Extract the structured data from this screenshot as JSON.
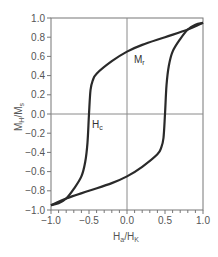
{
  "chart_data": {
    "type": "line",
    "title": "",
    "xlabel": "H_a/H_K",
    "ylabel": "M_H/M_s",
    "xlim": [
      -1.0,
      1.0
    ],
    "ylim": [
      -1.0,
      1.0
    ],
    "x_ticks": [
      "-1.0",
      "-0.5",
      "0.0",
      "0.5",
      "1.0"
    ],
    "y_ticks": [
      "1.0",
      "0.8",
      "0.6",
      "0.4",
      "0.2",
      "0.0",
      "-0.2",
      "-0.4",
      "-0.6",
      "-0.8",
      "-1.0"
    ],
    "grid": false,
    "zero_lines": true,
    "legend": null,
    "annotations": [
      {
        "text": "M_r",
        "x": 0.07,
        "y": 0.72
      },
      {
        "text": "H_c",
        "x": -0.4,
        "y": -0.1
      }
    ],
    "series": [
      {
        "name": "descending branch",
        "x": [
          1.0,
          0.8,
          0.5,
          0.2,
          0.0,
          -0.2,
          -0.4,
          -0.45,
          -0.48,
          -0.5,
          -0.52,
          -0.55,
          -0.6,
          -0.7,
          -0.8,
          -0.9,
          -1.0
        ],
        "y": [
          0.95,
          0.88,
          0.8,
          0.72,
          0.65,
          0.55,
          0.42,
          0.35,
          0.25,
          0.0,
          -0.3,
          -0.5,
          -0.65,
          -0.78,
          -0.88,
          -0.93,
          -0.95
        ]
      },
      {
        "name": "ascending branch",
        "x": [
          -1.0,
          -0.8,
          -0.5,
          -0.2,
          0.0,
          0.2,
          0.4,
          0.45,
          0.48,
          0.5,
          0.52,
          0.55,
          0.6,
          0.7,
          0.8,
          0.9,
          1.0
        ],
        "y": [
          -0.95,
          -0.88,
          -0.8,
          -0.72,
          -0.65,
          -0.55,
          -0.42,
          -0.35,
          -0.25,
          0.0,
          0.3,
          0.5,
          0.65,
          0.78,
          0.88,
          0.93,
          0.95
        ]
      }
    ]
  },
  "labels": {
    "xlabel_main": "H",
    "xlabel_sub1": "a",
    "xlabel_mid": "/H",
    "xlabel_sub2": "K",
    "ylabel_main": "M",
    "ylabel_sub1": "H",
    "ylabel_mid": "/M",
    "ylabel_sub2": "s",
    "mr_main": "M",
    "mr_sub": "r",
    "hc_main": "H",
    "hc_sub": "c"
  },
  "colors": {
    "curve": "#2a2a2a",
    "axis": "#777777",
    "zero_line": "#8a8a8a"
  }
}
